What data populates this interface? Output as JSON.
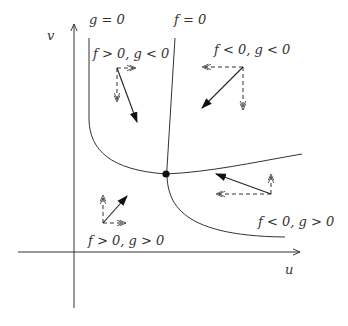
{
  "diagram": {
    "type": "phase-plane nullcline diagram",
    "axes": {
      "x_label": "u",
      "y_label": "v"
    },
    "nullclines": [
      {
        "label": "g = 0",
        "name": "g-nullcline"
      },
      {
        "label": "f = 0",
        "name": "f-nullcline"
      }
    ],
    "equilibrium": {
      "label": "equilibrium point"
    },
    "regions": [
      {
        "label": "f > 0, g < 0",
        "position": "top-left",
        "u_direction": "right",
        "v_direction": "down",
        "resultant": "down-right"
      },
      {
        "label": "f < 0, g < 0",
        "position": "top-right",
        "u_direction": "left",
        "v_direction": "down",
        "resultant": "down-left"
      },
      {
        "label": "f > 0, g > 0",
        "position": "bottom-left",
        "u_direction": "right",
        "v_direction": "up",
        "resultant": "up-right"
      },
      {
        "label": "f < 0, g > 0",
        "position": "bottom-right",
        "u_direction": "left",
        "v_direction": "up",
        "resultant": "up-left"
      }
    ],
    "colors": {
      "line": "#333333",
      "background": "#ffffff"
    }
  }
}
